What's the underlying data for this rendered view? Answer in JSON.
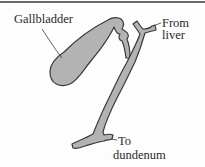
{
  "diagram": {
    "labels": {
      "gallbladder": "Gallbladder",
      "from_liver_line1": "From",
      "from_liver_line2": "liver",
      "to_duodenum_line1": "To",
      "to_duodenum_line2": "dundenum"
    },
    "colors": {
      "organ_fill": "#b3b3b3",
      "outline": "#3a3a3a",
      "text": "#2a2a2a",
      "border": "#6a6a6a",
      "background": "#fdfdfd"
    }
  }
}
